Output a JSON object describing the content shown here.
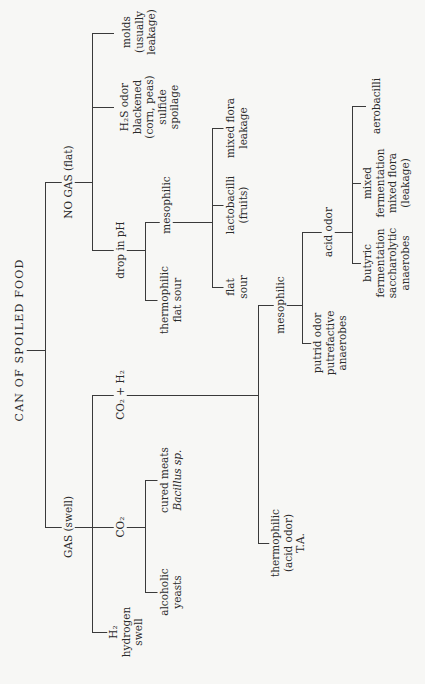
{
  "title": "CAN OF SPOILED FOOD",
  "nodes": {
    "no_gas": "NO GAS (flat)",
    "gas": "GAS (swell)",
    "molds": [
      "molds",
      "(usually",
      "leakage)"
    ],
    "h2s": [
      "H₂S odor",
      "blackened",
      "(corn, peas)",
      "sulfide",
      "spoilage"
    ],
    "drop_ph": "drop in pH",
    "thermo_flat": [
      "thermophilic",
      "flat sour"
    ],
    "meso_ph": "mesophilic",
    "flat_sour": [
      "flat",
      "sour"
    ],
    "lactobacilli": [
      "lactobacilli",
      "(fruits)"
    ],
    "mixed_flora": [
      "mixed flora",
      "leakage"
    ],
    "h2": [
      "H₂",
      "hydrogen",
      "swell"
    ],
    "co2": "CO₂",
    "alcoholic": [
      "alcoholic",
      "yeasts"
    ],
    "cured": [
      "cured meats",
      "Bacillus sp."
    ],
    "co2_h2": "CO₂ + H₂",
    "thermo_ta": [
      "thermophilic",
      "(acid odor)",
      "T.A."
    ],
    "meso_gas": "mesophilic",
    "putrid": [
      "putrid odor",
      "putrefactive",
      "anaerobes"
    ],
    "acid_odor": "acid odor",
    "butyric": [
      "butyric",
      "fermentation",
      "saccharolytic",
      "anaerobes"
    ],
    "mixed_ferm": [
      "mixed",
      "fermentation",
      "mixed flora",
      "(leakage)"
    ],
    "aerobacilli": "aerobacilli"
  }
}
